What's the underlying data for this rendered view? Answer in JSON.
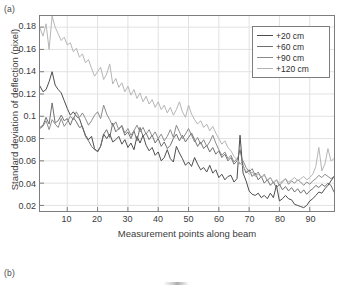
{
  "figure": {
    "panel_a_tag": "(a)",
    "panel_b_tag": "(b)"
  },
  "chart_data": {
    "type": "line",
    "title": "",
    "xlabel": "Measurement points along beam",
    "ylabel": "Standard deviation of deflection (pixel)",
    "xlim": [
      1,
      98
    ],
    "ylim": [
      0.015,
      0.19
    ],
    "xticks": [
      10,
      20,
      30,
      40,
      50,
      60,
      70,
      80,
      90
    ],
    "yticks": [
      0.02,
      0.04,
      0.06,
      0.08,
      0.1,
      0.12,
      0.14,
      0.16,
      0.18
    ],
    "ytick_labels": [
      "0.02",
      "0.04",
      "0.06",
      "0.08",
      "0.1",
      "0.12",
      "0.14",
      "0.16",
      "0.18"
    ],
    "xtick_labels": [
      "10",
      "20",
      "30",
      "40",
      "50",
      "60",
      "70",
      "80",
      "90"
    ],
    "grid": true,
    "legend_position": "top-right",
    "legend_entries": [
      "+20 cm",
      "+60 cm",
      "+90 cm",
      "+120 cm"
    ],
    "colors": [
      "#4b4b4b",
      "#6e6e6e",
      "#8a8a8a",
      "#b4b4b4"
    ],
    "x": [
      1,
      2,
      3,
      4,
      5,
      6,
      7,
      8,
      9,
      10,
      11,
      12,
      13,
      14,
      15,
      16,
      17,
      18,
      19,
      20,
      21,
      22,
      23,
      24,
      25,
      26,
      27,
      28,
      29,
      30,
      31,
      32,
      33,
      34,
      35,
      36,
      37,
      38,
      39,
      40,
      41,
      42,
      43,
      44,
      45,
      46,
      47,
      48,
      49,
      50,
      51,
      52,
      53,
      54,
      55,
      56,
      57,
      58,
      59,
      60,
      61,
      62,
      63,
      64,
      65,
      66,
      67,
      68,
      69,
      70,
      71,
      72,
      73,
      74,
      75,
      76,
      77,
      78,
      79,
      80,
      81,
      82,
      83,
      84,
      85,
      86,
      87,
      88,
      89,
      90,
      91,
      92,
      93,
      94,
      95,
      96,
      97,
      98
    ],
    "series": [
      {
        "name": "+20 cm",
        "color": "#4b4b4b",
        "values": [
          0.127,
          0.122,
          0.124,
          0.131,
          0.14,
          0.128,
          0.124,
          0.121,
          0.114,
          0.107,
          0.101,
          0.104,
          0.1,
          0.098,
          0.09,
          0.083,
          0.079,
          0.082,
          0.071,
          0.068,
          0.073,
          0.084,
          0.08,
          0.084,
          0.077,
          0.079,
          0.082,
          0.075,
          0.079,
          0.072,
          0.076,
          0.07,
          0.082,
          0.076,
          0.083,
          0.074,
          0.069,
          0.072,
          0.065,
          0.068,
          0.06,
          0.063,
          0.07,
          0.062,
          0.059,
          0.073,
          0.067,
          0.062,
          0.056,
          0.059,
          0.055,
          0.063,
          0.057,
          0.052,
          0.054,
          0.05,
          0.056,
          0.049,
          0.052,
          0.045,
          0.048,
          0.043,
          0.046,
          0.047,
          0.041,
          0.044,
          0.083,
          0.049,
          0.042,
          0.033,
          0.03,
          0.029,
          0.031,
          0.027,
          0.029,
          0.026,
          0.031,
          0.027,
          0.038,
          0.024,
          0.026,
          0.029,
          0.026,
          0.025,
          0.021,
          0.02,
          0.019,
          0.018,
          0.02,
          0.024,
          0.026,
          0.029,
          0.032,
          0.031,
          0.035,
          0.038,
          0.042,
          0.046
        ]
      },
      {
        "name": "+60 cm",
        "color": "#6e6e6e",
        "values": [
          0.09,
          0.092,
          0.099,
          0.093,
          0.112,
          0.094,
          0.096,
          0.101,
          0.096,
          0.098,
          0.092,
          0.099,
          0.095,
          0.09,
          0.091,
          0.082,
          0.078,
          0.073,
          0.07,
          0.069,
          0.073,
          0.084,
          0.088,
          0.081,
          0.094,
          0.086,
          0.089,
          0.091,
          0.083,
          0.086,
          0.08,
          0.087,
          0.078,
          0.09,
          0.082,
          0.085,
          0.079,
          0.083,
          0.076,
          0.08,
          0.073,
          0.077,
          0.071,
          0.074,
          0.08,
          0.084,
          0.078,
          0.083,
          0.077,
          0.081,
          0.085,
          0.079,
          0.073,
          0.077,
          0.071,
          0.074,
          0.068,
          0.072,
          0.066,
          0.069,
          0.063,
          0.066,
          0.06,
          0.063,
          0.057,
          0.06,
          0.07,
          0.056,
          0.049,
          0.052,
          0.046,
          0.049,
          0.043,
          0.046,
          0.04,
          0.043,
          0.038,
          0.041,
          0.036,
          0.039,
          0.034,
          0.037,
          0.033,
          0.036,
          0.032,
          0.035,
          0.031,
          0.034,
          0.03,
          0.033,
          0.035,
          0.038,
          0.036,
          0.039,
          0.037,
          0.04,
          0.038,
          0.032
        ]
      },
      {
        "name": "+90 cm",
        "color": "#8a8a8a",
        "values": [
          0.089,
          0.091,
          0.096,
          0.088,
          0.097,
          0.093,
          0.09,
          0.098,
          0.091,
          0.095,
          0.1,
          0.097,
          0.104,
          0.099,
          0.103,
          0.098,
          0.092,
          0.096,
          0.101,
          0.104,
          0.098,
          0.11,
          0.102,
          0.097,
          0.091,
          0.095,
          0.088,
          0.092,
          0.085,
          0.089,
          0.083,
          0.087,
          0.092,
          0.086,
          0.09,
          0.084,
          0.088,
          0.082,
          0.086,
          0.08,
          0.084,
          0.078,
          0.082,
          0.088,
          0.081,
          0.092,
          0.086,
          0.08,
          0.084,
          0.089,
          0.083,
          0.077,
          0.081,
          0.075,
          0.079,
          0.073,
          0.077,
          0.083,
          0.076,
          0.07,
          0.065,
          0.068,
          0.062,
          0.065,
          0.059,
          0.062,
          0.057,
          0.06,
          0.054,
          0.05,
          0.053,
          0.047,
          0.05,
          0.045,
          0.048,
          0.042,
          0.045,
          0.04,
          0.043,
          0.038,
          0.041,
          0.044,
          0.039,
          0.042,
          0.04,
          0.043,
          0.041,
          0.038,
          0.041,
          0.039,
          0.042,
          0.044,
          0.047,
          0.045,
          0.048,
          0.046,
          0.044,
          0.046
        ]
      },
      {
        "name": "+120 cm",
        "color": "#b4b4b4",
        "values": [
          0.179,
          0.172,
          0.183,
          0.16,
          0.19,
          0.18,
          0.174,
          0.168,
          0.171,
          0.164,
          0.166,
          0.158,
          0.161,
          0.153,
          0.156,
          0.148,
          0.151,
          0.143,
          0.136,
          0.14,
          0.144,
          0.133,
          0.138,
          0.147,
          0.129,
          0.134,
          0.126,
          0.13,
          0.122,
          0.127,
          0.119,
          0.124,
          0.116,
          0.121,
          0.113,
          0.118,
          0.111,
          0.115,
          0.108,
          0.113,
          0.106,
          0.11,
          0.103,
          0.108,
          0.101,
          0.106,
          0.113,
          0.104,
          0.099,
          0.11,
          0.102,
          0.097,
          0.093,
          0.096,
          0.09,
          0.093,
          0.087,
          0.091,
          0.085,
          0.08,
          0.075,
          0.078,
          0.072,
          0.069,
          0.064,
          0.061,
          0.058,
          0.055,
          0.051,
          0.048,
          0.05,
          0.046,
          0.048,
          0.045,
          0.047,
          0.043,
          0.045,
          0.041,
          0.043,
          0.04,
          0.042,
          0.044,
          0.041,
          0.043,
          0.045,
          0.042,
          0.044,
          0.046,
          0.043,
          0.045,
          0.048,
          0.055,
          0.072,
          0.051,
          0.057,
          0.071,
          0.06,
          0.062
        ]
      }
    ]
  }
}
